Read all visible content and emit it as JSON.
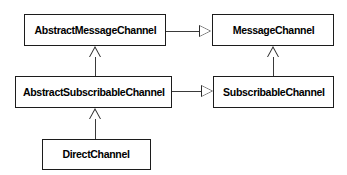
{
  "diagram": {
    "kind": "uml-class-diagram",
    "title": "",
    "background_color": "#ffffff",
    "box_fill_color": "#ffffff",
    "box_border_color": "#1c1c1c",
    "connector_color": "#3a3a3a",
    "text_color": "#000000",
    "classes": [
      {
        "id": "abstract-message-channel",
        "name": "AbstractMessageChannel"
      },
      {
        "id": "message-channel",
        "name": "MessageChannel"
      },
      {
        "id": "abstract-subscribable-channel",
        "name": "AbstractSubscribableChannel"
      },
      {
        "id": "subscribable-channel",
        "name": "SubscribableChannel"
      },
      {
        "id": "direct-channel",
        "name": "DirectChannel"
      }
    ],
    "relationships": [
      {
        "id": "rel-amc-mc",
        "from": "AbstractMessageChannel",
        "to": "MessageChannel",
        "type": "realization",
        "arrow": "hollow-triangle",
        "direction": "right"
      },
      {
        "id": "rel-asc-sc",
        "from": "AbstractSubscribableChannel",
        "to": "SubscribableChannel",
        "type": "realization",
        "arrow": "hollow-triangle",
        "direction": "right"
      },
      {
        "id": "rel-asc-amc",
        "from": "AbstractSubscribableChannel",
        "to": "AbstractMessageChannel",
        "type": "generalization",
        "arrow": "hollow-triangle",
        "direction": "up"
      },
      {
        "id": "rel-sc-mc",
        "from": "SubscribableChannel",
        "to": "MessageChannel",
        "type": "generalization",
        "arrow": "hollow-triangle",
        "direction": "up"
      },
      {
        "id": "rel-dc-asc",
        "from": "DirectChannel",
        "to": "AbstractSubscribableChannel",
        "type": "generalization",
        "arrow": "hollow-triangle",
        "direction": "up"
      }
    ]
  }
}
